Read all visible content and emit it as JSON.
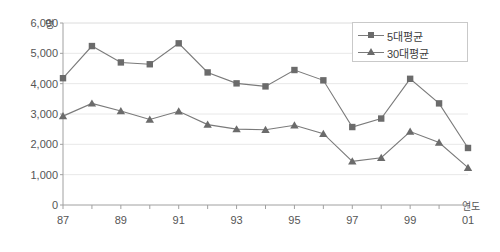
{
  "chart_data": {
    "type": "line",
    "title": "",
    "xlabel": "연도",
    "ylabel": "명",
    "ylim": [
      0,
      6000
    ],
    "ystep": 1000,
    "grid": true,
    "legend_position": "top-right",
    "x": [
      "87",
      "88",
      "89",
      "90",
      "91",
      "92",
      "93",
      "94",
      "95",
      "96",
      "97",
      "98",
      "99",
      "00",
      "01"
    ],
    "xtick_labels": [
      "87",
      "89",
      "91",
      "93",
      "95",
      "97",
      "99",
      "01"
    ],
    "ytick_labels": [
      "6,000",
      "5,000",
      "4,000",
      "3,000",
      "2,000",
      "1,000",
      "0"
    ],
    "ytick_values": [
      6000,
      5000,
      4000,
      3000,
      2000,
      1000,
      0
    ],
    "series": [
      {
        "name": "5대평균",
        "marker": "square",
        "color": "#6b6b6b",
        "values": [
          4180,
          5240,
          4700,
          4640,
          5330,
          4370,
          4010,
          3910,
          4450,
          4110,
          2570,
          2850,
          4160,
          3350,
          1880
        ]
      },
      {
        "name": "30대평균",
        "marker": "triangle",
        "color": "#6b6b6b",
        "values": [
          2930,
          3350,
          3100,
          2820,
          3090,
          2650,
          2500,
          2480,
          2630,
          2350,
          1440,
          1560,
          2420,
          2060,
          1230
        ]
      }
    ]
  },
  "legend": {
    "items": [
      {
        "label": "5대평균"
      },
      {
        "label": "30대평균"
      }
    ]
  },
  "axes": {
    "y_unit": "명",
    "x_unit": "연도"
  },
  "colors": {
    "series": "#6b6b6b",
    "line": "#7a7a7a",
    "grid": "#e8e8e8",
    "axis": "#a0a0a0",
    "text": "#555555"
  }
}
